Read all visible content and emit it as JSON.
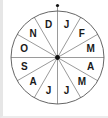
{
  "diagram": {
    "type": "month-wheel",
    "center": {
      "x": 57.5,
      "y": 57.5
    },
    "radius": 46.5,
    "segments": 12,
    "start_marker": "top-dot",
    "months": [
      {
        "label": "J"
      },
      {
        "label": "F"
      },
      {
        "label": "M"
      },
      {
        "label": "A"
      },
      {
        "label": "M"
      },
      {
        "label": "J"
      },
      {
        "label": "J"
      },
      {
        "label": "A"
      },
      {
        "label": "S"
      },
      {
        "label": "O"
      },
      {
        "label": "N"
      },
      {
        "label": "D"
      }
    ],
    "colors": {
      "stroke": "#555555",
      "text": "#1a1a1a",
      "center_dot": "#111111",
      "background": "#ffffff"
    }
  }
}
